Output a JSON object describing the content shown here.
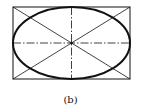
{
  "figure": {
    "caption": "(b)",
    "colors": {
      "stroke": "#111111",
      "background": "#ffffff"
    },
    "rectangle": {
      "x": 13,
      "y": 7,
      "width": 117,
      "height": 72
    },
    "ellipse": {
      "cx": 71.5,
      "cy": 43,
      "rx": 58.5,
      "ry": 36
    },
    "center_lines": "dash-dot",
    "diagonals": 2
  }
}
